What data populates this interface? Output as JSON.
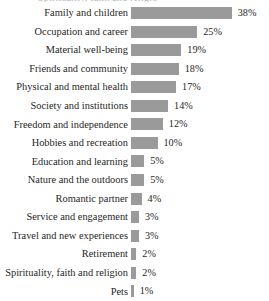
{
  "title_clip": "Spirituality, faith and religion",
  "chart_data": {
    "type": "bar",
    "orientation": "horizontal",
    "title": "",
    "xlabel": "",
    "ylabel": "",
    "grid": false,
    "legend": null,
    "axis_visible": false,
    "value_suffix": "%",
    "xlim": [
      0,
      38
    ],
    "bar_color": "#9a9a9a",
    "background_color": "#ffffff",
    "categories": [
      "Family and children",
      "Occupation and career",
      "Material well-being",
      "Friends and community",
      "Physical and mental health",
      "Society and institutions",
      "Freedom and independence",
      "Hobbies and recreation",
      "Education and learning",
      "Nature and the outdoors",
      "Romantic partner",
      "Service and engagement",
      "Travel and new experiences",
      "Retirement",
      "Spirituality, faith and religion",
      "Pets"
    ],
    "values": [
      38,
      25,
      19,
      18,
      17,
      14,
      12,
      10,
      5,
      5,
      4,
      3,
      3,
      2,
      2,
      1
    ],
    "value_labels": [
      "38%",
      "25%",
      "19%",
      "18%",
      "17%",
      "14%",
      "12%",
      "10%",
      "5%",
      "5%",
      "4%",
      "3%",
      "3%",
      "2%",
      "2%",
      "1%"
    ]
  }
}
